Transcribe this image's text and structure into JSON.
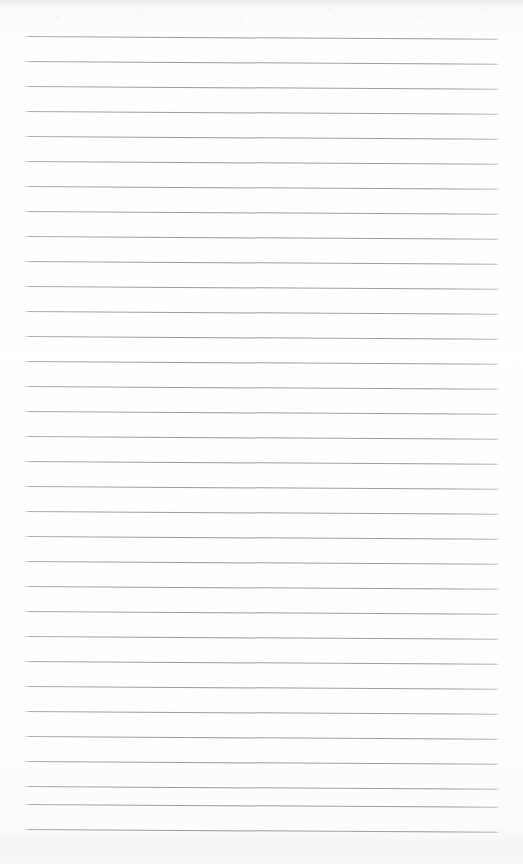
{
  "document": {
    "kind": "ruled-notebook-page",
    "title": "Blank ruled notebook page",
    "page_label": "",
    "written_text": "",
    "header_text": "",
    "footer_text": ""
  },
  "paper": {
    "background_color": "#fdfdfd",
    "edge_tint_color": "#f4f4f5",
    "width_px": 523,
    "height_px": 864
  },
  "ruling": {
    "line_color": "#9a9da4",
    "line_count": 33,
    "line_thickness_px": 1,
    "line_spacing_px": 25,
    "first_line_y_px": 35.6,
    "line_start_x_px": 24,
    "line_end_x_px": 500,
    "tilt_degrees": 0.34,
    "margin_rule": "none",
    "lines_y": [
      35.6,
      60.6,
      85.6,
      110.6,
      135.6,
      160.6,
      185.6,
      210.6,
      235.6,
      260.6,
      285.6,
      310.6,
      335.6,
      360.6,
      385.6,
      410.6,
      435.6,
      460.6,
      485.6,
      510.6,
      535.6,
      560.6,
      585.6,
      610.6,
      635.6,
      660.6,
      685.6,
      710.6,
      735.6,
      760.6,
      785.6,
      803.6,
      828.6
    ]
  }
}
